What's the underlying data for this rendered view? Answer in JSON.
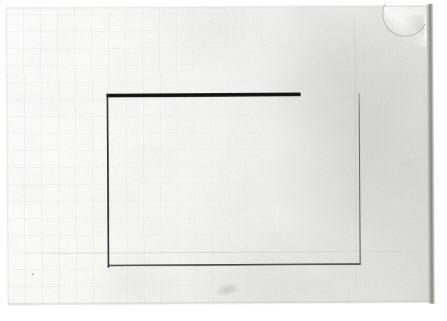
{
  "image": {
    "subject": "photograph of an aged sheet of paper with a hand-drawn rectangle",
    "width": 447,
    "height": 321,
    "background_color": "#ffffff"
  },
  "paper": {
    "name": "paper-sheet",
    "description": "off-white aged paper sheet, slightly rotated, faint graph-paper grid on the left half and grey soiling toward the right edge",
    "base_color": "#f3f3f1",
    "highlight_color": "#ffffff",
    "soil_color": "#d6d6d2",
    "edge_shadow_color": "#5c5c58",
    "rotation_deg": -0.35,
    "bounds": {
      "left": 7,
      "top": 7,
      "width": 424,
      "height": 296
    },
    "features": [
      {
        "name": "curled-corner",
        "location": "top-right",
        "description": "corner of the sheet is curled up revealing a crescent shadow"
      },
      {
        "name": "horizontal-crease",
        "location": "lower third",
        "description": "faint horizontal fold line running the width of the sheet"
      },
      {
        "name": "vertical-crease",
        "location": "right side",
        "description": "faint vertical fold line"
      },
      {
        "name": "crease-bump",
        "location": "bottom center",
        "description": "small raised crease near the bottom edge"
      },
      {
        "name": "ink-fleck",
        "location": "bottom-left",
        "description": "tiny dark speck on the paper"
      }
    ]
  },
  "drawing": {
    "name": "hand-drawn-rectangle",
    "shape": "rectangle",
    "closed": false,
    "note": "open at the top-right corner: the heavy top stroke stops well before the thin right stroke begins",
    "strokes": [
      {
        "name": "top-stroke",
        "orientation": "horizontal",
        "weight": "very heavy",
        "color": "#0e0e10",
        "x1": 100,
        "y1": 88,
        "x2": 294,
        "y2": 88,
        "length_px": 194,
        "thickness_px": 4
      },
      {
        "name": "left-stroke",
        "orientation": "vertical",
        "weight": "medium-heavy",
        "color": "#1e1e20",
        "x1": 101,
        "y1": 86,
        "x2": 101,
        "y2": 260,
        "length_px": 174,
        "thickness_px": 2
      },
      {
        "name": "bottom-stroke",
        "orientation": "horizontal",
        "weight": "medium",
        "color": "#26262 8",
        "x1": 100,
        "y1": 258,
        "x2": 353,
        "y2": 258,
        "length_px": 253,
        "thickness_px": 2
      },
      {
        "name": "right-stroke",
        "orientation": "vertical",
        "weight": "light",
        "color": "#545456",
        "x1": 353,
        "y1": 87,
        "x2": 353,
        "y2": 258,
        "length_px": 171,
        "thickness_px": 1
      }
    ],
    "corner_gap": {
      "name": "top-right-gap",
      "from_x": 294,
      "to_x": 353,
      "y": 88,
      "width_px": 59
    }
  }
}
